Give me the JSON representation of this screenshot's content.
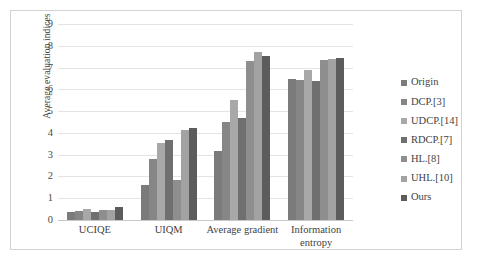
{
  "chart_data": {
    "type": "bar",
    "title": "",
    "subtitle": "",
    "xlabel": "",
    "ylabel": "Average evaluation indices",
    "categories": [
      "UCIQE",
      "UIQM",
      "Average gradient",
      "Information entropy"
    ],
    "ylim": [
      0,
      9
    ],
    "yticks": [
      0,
      1,
      2,
      3,
      4,
      5,
      6,
      7,
      8,
      9
    ],
    "ytick_labels": [
      "0",
      "1",
      "2",
      "3",
      "4",
      "5",
      "6",
      "7",
      "8",
      "9"
    ],
    "grid": true,
    "legend_position": "right",
    "series": [
      {
        "name": "Origin",
        "color": "#7b7b7b",
        "values": [
          0.36,
          1.62,
          3.18,
          6.48
        ]
      },
      {
        "name": "DCP.[3]",
        "color": "#868686",
        "values": [
          0.43,
          2.8,
          4.52,
          6.45
        ]
      },
      {
        "name": "UDCP.[14]",
        "color": "#a8a8a8",
        "values": [
          0.5,
          3.52,
          5.53,
          6.88
        ]
      },
      {
        "name": "RDCP.[7]",
        "color": "#6f6f6f",
        "values": [
          0.37,
          3.66,
          4.68,
          6.37
        ]
      },
      {
        "name": "HL.[8]",
        "color": "#8e8e8e",
        "values": [
          0.45,
          1.82,
          7.28,
          7.37
        ]
      },
      {
        "name": "UHL.[10]",
        "color": "#a2a2a2",
        "values": [
          0.47,
          4.12,
          7.72,
          7.4
        ]
      },
      {
        "name": "Ours",
        "color": "#5c5c5c",
        "values": [
          0.6,
          4.23,
          7.52,
          7.42
        ]
      }
    ]
  },
  "colors": {
    "background": "#ffffff",
    "frame_border": "#d3d3d3",
    "gridline": "#e4e4e4",
    "axis": "#c8c8c8",
    "text": "#3f3f3f"
  }
}
